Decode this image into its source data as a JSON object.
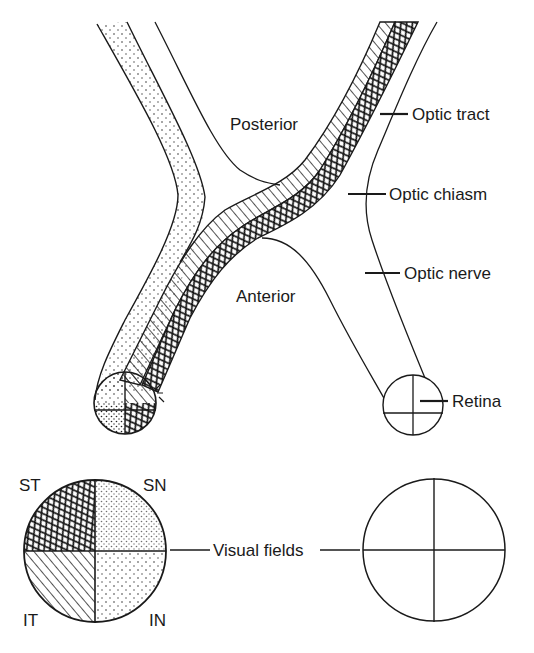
{
  "diagram": {
    "regions": {
      "posterior": "Posterior",
      "anterior": "Anterior"
    },
    "structures": {
      "optic_tract": "Optic tract",
      "optic_chiasm": "Optic chiasm",
      "optic_nerve": "Optic nerve",
      "retina": "Retina",
      "visual_fields": "Visual fields"
    },
    "quadrants": {
      "st": "ST",
      "sn": "SN",
      "it": "IT",
      "in": "IN"
    },
    "colors": {
      "ink": "#1a1a1a",
      "background": "#ffffff"
    }
  }
}
